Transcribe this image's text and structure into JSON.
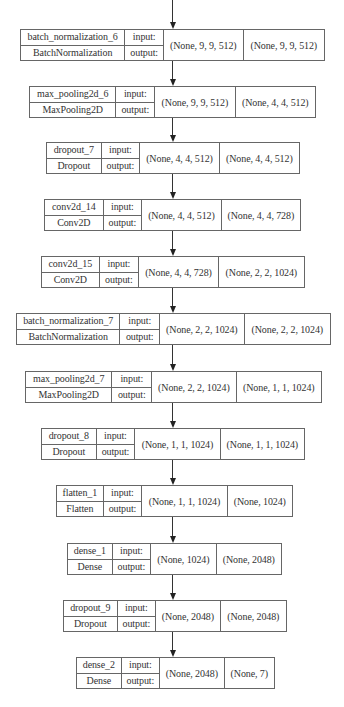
{
  "diagram": {
    "type": "keras_model_plot",
    "io_labels": {
      "input": "input:",
      "output": "output:"
    },
    "colors": {
      "border": "#666666",
      "text": "#333333",
      "arrow": "#222222",
      "background": "#ffffff"
    },
    "arrow_x": 172,
    "top_incoming_edge": {
      "y1": 0,
      "y2": 29
    },
    "nodes": [
      {
        "name": "batch_normalization_6",
        "class": "BatchNormalization",
        "input": "(None, 9, 9, 512)",
        "output": "(None, 9, 9, 512)",
        "box": {
          "x": 20,
          "y": 29,
          "name_w": 104,
          "io_w": 39,
          "in_w": 80,
          "out_w": 82
        }
      },
      {
        "name": "max_pooling2d_6",
        "class": "MaxPooling2D",
        "input": "(None, 9, 9, 512)",
        "output": "(None, 4, 4, 512)",
        "box": {
          "x": 29,
          "y": 86,
          "name_w": 86,
          "io_w": 39,
          "in_w": 81,
          "out_w": 81
        }
      },
      {
        "name": "dropout_7",
        "class": "Dropout",
        "input": "(None, 4, 4, 512)",
        "output": "(None, 4, 4, 512)",
        "box": {
          "x": 46,
          "y": 142,
          "name_w": 54,
          "io_w": 39,
          "in_w": 80,
          "out_w": 81
        }
      },
      {
        "name": "conv2d_14",
        "class": "Conv2D",
        "input": "(None, 4, 4, 512)",
        "output": "(None, 4, 4, 728)",
        "box": {
          "x": 44,
          "y": 199,
          "name_w": 58,
          "io_w": 39,
          "in_w": 80,
          "out_w": 80
        }
      },
      {
        "name": "conv2d_15",
        "class": "Conv2D",
        "input": "(None, 4, 4, 728)",
        "output": "(None, 2, 2, 1024)",
        "box": {
          "x": 41,
          "y": 256,
          "name_w": 57,
          "io_w": 40,
          "in_w": 80,
          "out_w": 87
        }
      },
      {
        "name": "batch_normalization_7",
        "class": "BatchNormalization",
        "input": "(None, 2, 2, 1024)",
        "output": "(None, 2, 2, 1024)",
        "box": {
          "x": 16,
          "y": 313,
          "name_w": 103,
          "io_w": 40,
          "in_w": 85,
          "out_w": 87
        }
      },
      {
        "name": "max_pooling2d_7",
        "class": "MaxPooling2D",
        "input": "(None, 2, 2, 1024)",
        "output": "(None, 1, 1, 1024)",
        "box": {
          "x": 25,
          "y": 371,
          "name_w": 86,
          "io_w": 40,
          "in_w": 85,
          "out_w": 86
        }
      },
      {
        "name": "dropout_8",
        "class": "Dropout",
        "input": "(None, 1, 1, 1024)",
        "output": "(None, 1, 1, 1024)",
        "box": {
          "x": 41,
          "y": 428,
          "name_w": 54,
          "io_w": 39,
          "in_w": 86,
          "out_w": 85
        }
      },
      {
        "name": "flatten_1",
        "class": "Flatten",
        "input": "(None, 1, 1, 1024)",
        "output": "(None, 1024)",
        "box": {
          "x": 56,
          "y": 485,
          "name_w": 46,
          "io_w": 39,
          "in_w": 86,
          "out_w": 66
        }
      },
      {
        "name": "dense_1",
        "class": "Dense",
        "input": "(None, 1024)",
        "output": "(None, 2048)",
        "box": {
          "x": 67,
          "y": 543,
          "name_w": 44,
          "io_w": 39,
          "in_w": 66,
          "out_w": 66
        }
      },
      {
        "name": "dropout_9",
        "class": "Dropout",
        "input": "(None, 2048)",
        "output": "(None, 2048)",
        "box": {
          "x": 63,
          "y": 600,
          "name_w": 53,
          "io_w": 39,
          "in_w": 65,
          "out_w": 67
        }
      },
      {
        "name": "dense_2",
        "class": "Dense",
        "input": "(None, 2048)",
        "output": "(None, 7)",
        "box": {
          "x": 76,
          "y": 657,
          "name_w": 44,
          "io_w": 39,
          "in_w": 65,
          "out_w": 51
        }
      }
    ]
  }
}
